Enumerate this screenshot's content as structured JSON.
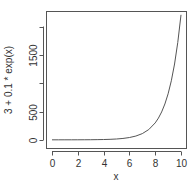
{
  "chart_data": {
    "type": "line",
    "title": "",
    "xlabel": "x",
    "ylabel": "3 + 0.1 * exp(x)",
    "xlim": [
      0,
      10
    ],
    "ylim": [
      0,
      2205.6
    ],
    "x_ticks": [
      0,
      2,
      4,
      6,
      8,
      10
    ],
    "x_tick_labels": [
      "0",
      "2",
      "4",
      "6",
      "8",
      "10"
    ],
    "y_ticks": [
      0,
      500,
      1000,
      1500,
      2000
    ],
    "y_tick_labels": [
      "0",
      "500",
      "",
      "1500",
      ""
    ],
    "grid": false,
    "legend": null,
    "series": [
      {
        "name": "3 + 0.1 * exp(x)",
        "x": [
          0,
          0.5,
          1,
          1.5,
          2,
          2.5,
          3,
          3.5,
          4,
          4.5,
          5,
          5.5,
          6,
          6.5,
          7,
          7.5,
          8,
          8.25,
          8.5,
          8.75,
          9,
          9.25,
          9.5,
          9.75,
          10
        ],
        "values": [
          3.1,
          3.16,
          3.27,
          3.45,
          3.74,
          4.22,
          5.01,
          6.31,
          8.46,
          12.0,
          17.84,
          27.47,
          43.34,
          69.51,
          112.66,
          183.8,
          301.1,
          386.2,
          494.5,
          634.5,
          813.3,
          1043.0,
          1339.0,
          1719.0,
          2205.6
        ]
      }
    ],
    "line_color": "#555555"
  }
}
